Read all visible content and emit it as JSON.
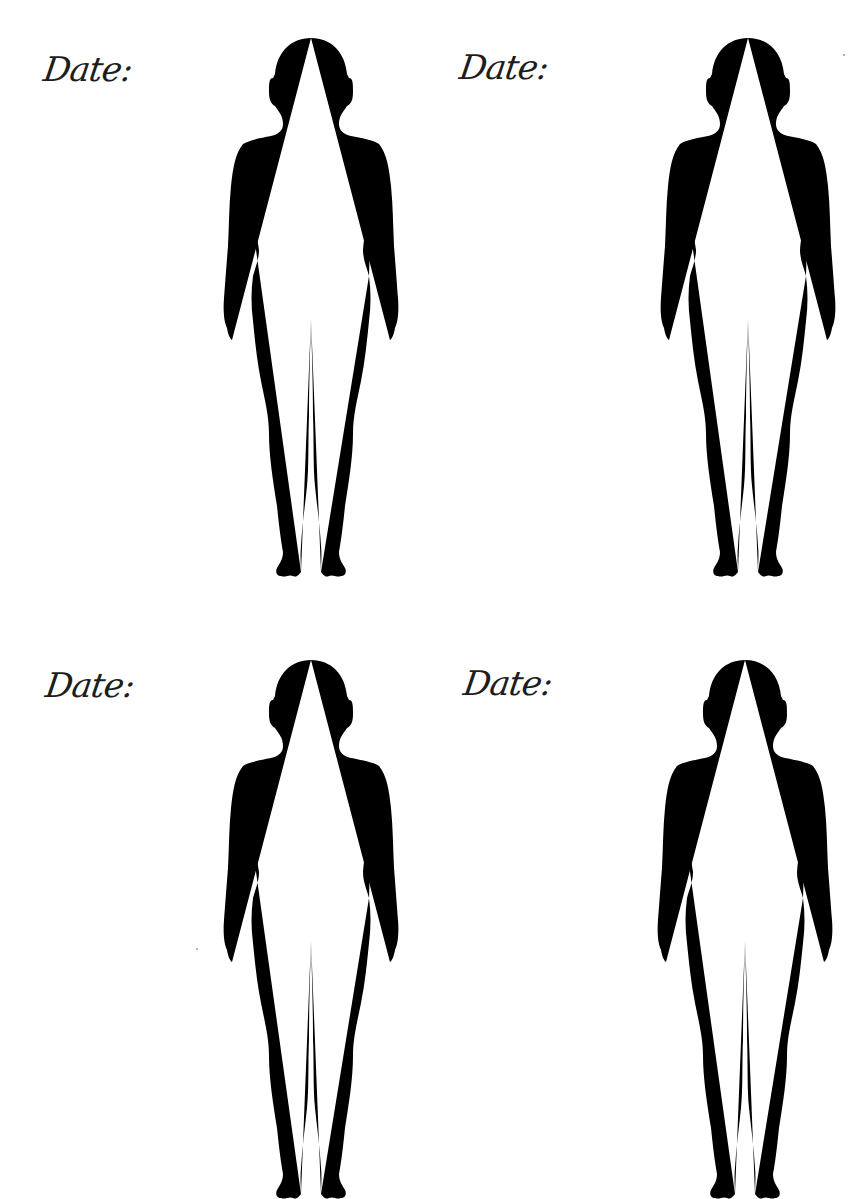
{
  "worksheet": {
    "type": "body-outline-tracker",
    "background_color": "#ffffff",
    "line_color": "#5a5a5a",
    "text_color": "#1d1d1d",
    "panels": [
      {
        "position": "top-left",
        "date_label": "Date:",
        "figure": "front-view-female-outline"
      },
      {
        "position": "top-right",
        "date_label": "Date:",
        "figure": "front-view-female-outline"
      },
      {
        "position": "bottom-left",
        "date_label": "Date:",
        "figure": "front-view-female-outline"
      },
      {
        "position": "bottom-right",
        "date_label": "Date:",
        "figure": "front-view-female-outline"
      }
    ]
  }
}
